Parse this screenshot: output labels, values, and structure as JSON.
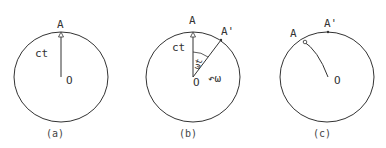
{
  "panels": [
    {
      "caption": "(a)",
      "point_A": "A",
      "radius_label": "ct",
      "center_label": "O"
    },
    {
      "caption": "(b)",
      "point_A": "A",
      "point_A_prime": "A'",
      "radius_label": "ct",
      "angle_label": "ωt",
      "rotation_label": "↶ω",
      "center_label": "O"
    },
    {
      "caption": "(c)",
      "point_A": "A",
      "point_A_prime": "A'",
      "center_label": "O"
    }
  ],
  "style": {
    "stroke": "#333333",
    "background": "#ffffff"
  }
}
